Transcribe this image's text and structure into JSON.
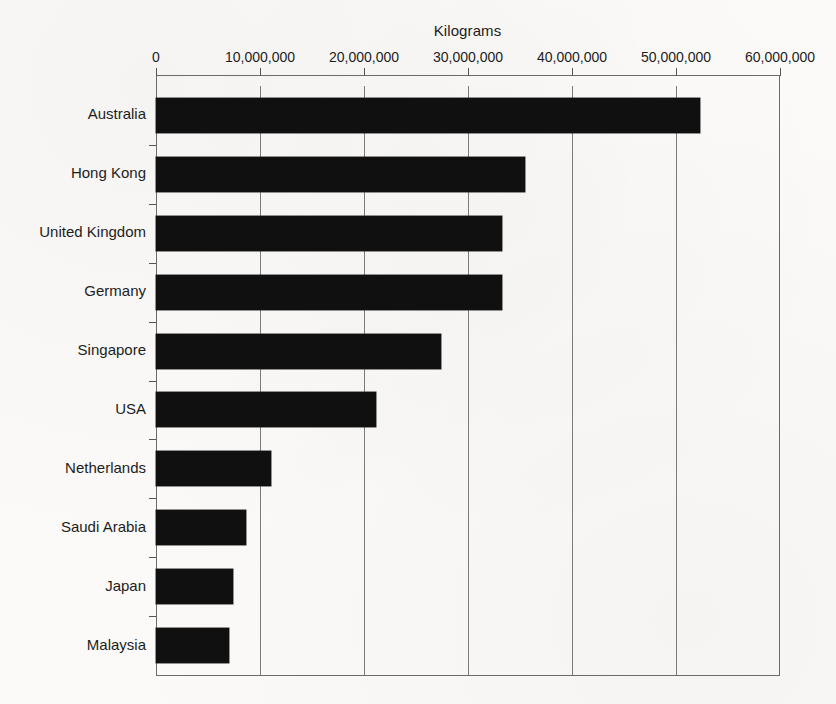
{
  "chart_data": {
    "type": "bar",
    "orientation": "horizontal",
    "title": "Kilograms",
    "xlabel": "",
    "ylabel": "",
    "categories": [
      "Australia",
      "Hong Kong",
      "United Kingdom",
      "Germany",
      "Singapore",
      "USA",
      "Netherlands",
      "Saudi Arabia",
      "Japan",
      "Malaysia"
    ],
    "values": [
      52300000,
      35500000,
      33300000,
      33300000,
      27400000,
      21200000,
      11100000,
      8700000,
      7400000,
      7000000
    ],
    "xlim": [
      0,
      60000000
    ],
    "xticks": [
      0,
      10000000,
      20000000,
      30000000,
      40000000,
      50000000,
      60000000
    ],
    "xtick_labels": [
      "0",
      "10,000,000",
      "20,000,000",
      "30,000,000",
      "40,000,000",
      "50,000,000",
      "60,000,000"
    ],
    "grid": true,
    "grid_axis": "x",
    "legend": null,
    "bar_color": "#111010",
    "axis_color": "#6b6b6b",
    "background_color": "#fbfaf8",
    "axis_position": "top"
  }
}
